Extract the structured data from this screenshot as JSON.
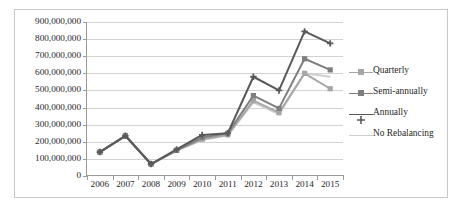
{
  "chart_data": {
    "type": "line",
    "title": "",
    "subtitle": "",
    "xlabel": "",
    "ylabel": "",
    "grid": true,
    "legend_position": "right",
    "ylim": [
      0,
      900000000
    ],
    "ytick_step": 100000000,
    "categories": [
      "2006",
      "2007",
      "2008",
      "2009",
      "2010",
      "2011",
      "2012",
      "2013",
      "2014",
      "2015"
    ],
    "ytick_labels": [
      "900,000,000",
      "800,000,000",
      "700,000,000",
      "600,000,000",
      "500,000,000",
      "400,000,000",
      "300,000,000",
      "200,000,000",
      "100,000,000",
      "0"
    ],
    "ytick_values": [
      900000000,
      800000000,
      700000000,
      600000000,
      500000000,
      400000000,
      300000000,
      200000000,
      100000000,
      0
    ],
    "series": [
      {
        "name": "Quarterly",
        "color": "#a6a6a6",
        "marker": "square",
        "values": [
          140000000,
          235000000,
          70000000,
          150000000,
          215000000,
          240000000,
          440000000,
          370000000,
          600000000,
          510000000
        ]
      },
      {
        "name": "Semi-annually",
        "color": "#7f7f7f",
        "marker": "square",
        "values": [
          140000000,
          235000000,
          70000000,
          150000000,
          225000000,
          250000000,
          470000000,
          395000000,
          685000000,
          620000000
        ]
      },
      {
        "name": "Annually",
        "color": "#595959",
        "marker": "cross",
        "values": [
          140000000,
          235000000,
          70000000,
          155000000,
          240000000,
          250000000,
          580000000,
          500000000,
          845000000,
          775000000
        ]
      },
      {
        "name": "No Rebalancing",
        "color": "#cfcfcf",
        "marker": "none",
        "values": [
          140000000,
          235000000,
          70000000,
          148000000,
          210000000,
          238000000,
          430000000,
          360000000,
          600000000,
          580000000
        ]
      }
    ]
  },
  "legend": {
    "items": [
      {
        "label": "Quarterly"
      },
      {
        "label": "Semi-annually"
      },
      {
        "label": "Annually"
      },
      {
        "label": "No Rebalancing"
      }
    ]
  },
  "colors": {
    "gridline": "#d2d2d2",
    "axis": "#9a9a9a",
    "frame_border": "#c8c8c8",
    "background": "#ffffff",
    "text": "#262626"
  }
}
